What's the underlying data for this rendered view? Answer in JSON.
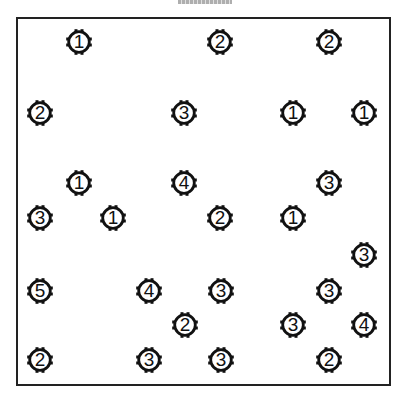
{
  "puzzle": {
    "type": "hashi-bridges",
    "stroke_color": "#111111",
    "border_color": "#222222",
    "background": "#ffffff",
    "islands": [
      {
        "x": 79,
        "y": 42,
        "value": "1"
      },
      {
        "x": 220,
        "y": 42,
        "value": "2"
      },
      {
        "x": 329,
        "y": 42,
        "value": "2"
      },
      {
        "x": 40,
        "y": 113,
        "value": "2"
      },
      {
        "x": 184,
        "y": 113,
        "value": "3"
      },
      {
        "x": 293,
        "y": 113,
        "value": "1"
      },
      {
        "x": 364,
        "y": 113,
        "value": "1"
      },
      {
        "x": 79,
        "y": 183,
        "value": "1"
      },
      {
        "x": 184,
        "y": 183,
        "value": "4"
      },
      {
        "x": 329,
        "y": 183,
        "value": "3"
      },
      {
        "x": 40,
        "y": 218,
        "value": "3"
      },
      {
        "x": 113,
        "y": 218,
        "value": "1"
      },
      {
        "x": 220,
        "y": 218,
        "value": "2"
      },
      {
        "x": 293,
        "y": 218,
        "value": "1"
      },
      {
        "x": 364,
        "y": 255,
        "value": "3"
      },
      {
        "x": 40,
        "y": 291,
        "value": "5"
      },
      {
        "x": 149,
        "y": 291,
        "value": "4"
      },
      {
        "x": 221,
        "y": 291,
        "value": "3"
      },
      {
        "x": 329,
        "y": 291,
        "value": "3"
      },
      {
        "x": 185,
        "y": 325,
        "value": "2"
      },
      {
        "x": 293,
        "y": 325,
        "value": "3"
      },
      {
        "x": 364,
        "y": 325,
        "value": "4"
      },
      {
        "x": 40,
        "y": 360,
        "value": "2"
      },
      {
        "x": 149,
        "y": 360,
        "value": "3"
      },
      {
        "x": 221,
        "y": 360,
        "value": "3"
      },
      {
        "x": 329,
        "y": 360,
        "value": "2"
      }
    ]
  }
}
